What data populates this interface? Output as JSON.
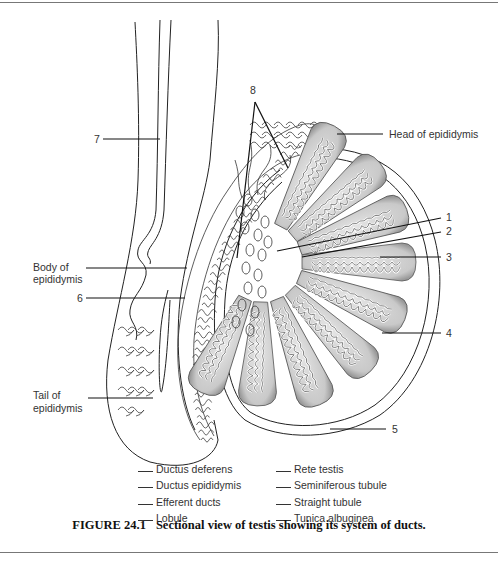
{
  "figure": {
    "number": "FIGURE 24.1",
    "caption": "Sectional view of testis showing its system of ducts."
  },
  "labels": {
    "n1": "1",
    "n2": "2",
    "n3": "3",
    "n4": "4",
    "n5": "5",
    "n6": "6",
    "n7": "7",
    "n8": "8",
    "head_epididymis": "Head of epididymis",
    "body_epididymis_line1": "Body of",
    "body_epididymis_line2": "epididymis",
    "tail_epididymis_line1": "Tail of",
    "tail_epididymis_line2": "epididymis"
  },
  "answer_key": {
    "left": [
      {
        "blank": "",
        "term": "Ductus deferens"
      },
      {
        "blank": "",
        "term": "Ductus epididymis"
      },
      {
        "blank": "",
        "term": "Efferent ducts"
      },
      {
        "blank": "",
        "term": "Lobule"
      }
    ],
    "right": [
      {
        "blank": "",
        "term": "Rete testis"
      },
      {
        "blank": "",
        "term": "Seminiferous tubule"
      },
      {
        "blank": "",
        "term": "Straight tubule"
      },
      {
        "blank": "",
        "term": "Tunica albuginea"
      }
    ]
  }
}
